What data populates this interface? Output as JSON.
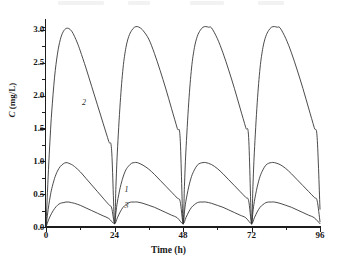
{
  "chart_data": {
    "type": "line",
    "title": "",
    "xlabel": "Time (h)",
    "ylabel": "C (mg/L)",
    "ylabel_italic_part": "C",
    "ylabel_rest": " (mg/L)",
    "xlim": [
      0,
      96
    ],
    "ylim": [
      0.0,
      3.15
    ],
    "grid": false,
    "legend_position": "inline-curve-labels",
    "x_ticks": [
      0,
      24,
      48,
      72,
      96
    ],
    "x_tick_labels": [
      "0",
      "24",
      "48",
      "72",
      "96"
    ],
    "x_minor_ticks": [
      12,
      36,
      60,
      84
    ],
    "y_ticks": [
      0.0,
      0.5,
      1.0,
      1.5,
      2.0,
      2.5,
      3.0
    ],
    "y_tick_labels": [
      "0.0",
      "0.5",
      "1.0",
      "1.5",
      "2.0",
      "2.5",
      "3.0"
    ],
    "y_minor_ticks": [
      0.25,
      0.75,
      1.25,
      1.75,
      2.25,
      2.75,
      3.05
    ],
    "dosing_interval_h": 24,
    "line_color": "#2b2b2b",
    "series": [
      {
        "name": "1",
        "label": "1",
        "label_x": 27.5,
        "label_y": 0.57,
        "peak_value": 0.98,
        "trough_value": 0.05,
        "time_to_peak_h": 7,
        "x": [
          0,
          0.5,
          1,
          1.5,
          2,
          3,
          4,
          5,
          6,
          7,
          8,
          9,
          10,
          12,
          14,
          16,
          18,
          20,
          22,
          23,
          24,
          24.5,
          25,
          26,
          27,
          28,
          29,
          30,
          31,
          32,
          34,
          36,
          38,
          40,
          42,
          44,
          46,
          47,
          48,
          48.5,
          49,
          50,
          51,
          52,
          53,
          54,
          55,
          56,
          58,
          60,
          62,
          64,
          66,
          68,
          70,
          71,
          72,
          72.5,
          73,
          74,
          75,
          76,
          77,
          78,
          79,
          80,
          82,
          84,
          86,
          88,
          90,
          92,
          94,
          95,
          96
        ],
        "y": [
          0.0,
          0.18,
          0.34,
          0.47,
          0.58,
          0.74,
          0.85,
          0.92,
          0.96,
          0.98,
          0.97,
          0.95,
          0.92,
          0.84,
          0.74,
          0.64,
          0.54,
          0.44,
          0.34,
          0.29,
          0.05,
          0.22,
          0.38,
          0.6,
          0.76,
          0.87,
          0.93,
          0.97,
          0.98,
          0.98,
          0.94,
          0.88,
          0.8,
          0.71,
          0.62,
          0.53,
          0.44,
          0.39,
          0.06,
          0.23,
          0.39,
          0.61,
          0.77,
          0.87,
          0.94,
          0.97,
          0.98,
          0.98,
          0.95,
          0.89,
          0.81,
          0.72,
          0.63,
          0.54,
          0.45,
          0.4,
          0.06,
          0.23,
          0.39,
          0.61,
          0.77,
          0.87,
          0.94,
          0.97,
          0.98,
          0.98,
          0.95,
          0.89,
          0.81,
          0.72,
          0.63,
          0.54,
          0.45,
          0.4,
          0.08
        ]
      },
      {
        "name": "2",
        "label": "2",
        "label_x": 12.6,
        "label_y": 1.88,
        "peak_value": 3.05,
        "trough_value": 0.06,
        "time_to_peak_h": 8,
        "x": [
          0,
          0.5,
          1,
          1.5,
          2,
          3,
          4,
          5,
          6,
          7,
          8,
          9,
          10,
          11,
          12,
          14,
          16,
          18,
          20,
          22,
          23,
          24,
          24.5,
          25,
          26,
          27,
          28,
          29,
          30,
          31,
          32,
          33,
          34,
          36,
          38,
          40,
          42,
          44,
          46,
          47,
          48,
          48.5,
          49,
          50,
          51,
          52,
          53,
          54,
          55,
          56,
          57,
          58,
          60,
          62,
          64,
          66,
          68,
          70,
          71,
          72,
          72.5,
          73,
          74,
          75,
          76,
          77,
          78,
          79,
          80,
          81,
          82,
          84,
          86,
          88,
          90,
          92,
          94,
          95,
          96
        ],
        "y": [
          0.0,
          0.52,
          0.99,
          1.4,
          1.75,
          2.28,
          2.63,
          2.85,
          2.97,
          3.02,
          3.02,
          2.98,
          2.9,
          2.8,
          2.68,
          2.42,
          2.14,
          1.86,
          1.58,
          1.3,
          1.16,
          0.06,
          0.62,
          1.14,
          1.89,
          2.42,
          2.73,
          2.9,
          2.99,
          3.04,
          3.05,
          3.03,
          2.99,
          2.86,
          2.64,
          2.38,
          2.1,
          1.8,
          1.5,
          1.35,
          0.06,
          0.62,
          1.14,
          1.89,
          2.42,
          2.73,
          2.9,
          2.99,
          3.04,
          3.05,
          3.04,
          3.03,
          2.87,
          2.65,
          2.39,
          2.11,
          1.81,
          1.51,
          1.36,
          0.06,
          0.62,
          1.14,
          1.89,
          2.42,
          2.73,
          2.9,
          2.99,
          3.04,
          3.05,
          3.04,
          3.03,
          2.87,
          2.65,
          2.39,
          2.11,
          1.81,
          1.51,
          1.36,
          0.27
        ]
      },
      {
        "name": "3",
        "label": "3",
        "label_x": 27.5,
        "label_y": 0.32,
        "peak_value": 0.38,
        "trough_value": 0.04,
        "time_to_peak_h": 8,
        "x": [
          0,
          1,
          2,
          3,
          4,
          5,
          6,
          7,
          8,
          9,
          10,
          12,
          14,
          16,
          18,
          20,
          22,
          24,
          25,
          26,
          27,
          28,
          29,
          30,
          31,
          32,
          34,
          36,
          38,
          40,
          42,
          44,
          46,
          48,
          49,
          50,
          51,
          52,
          53,
          54,
          55,
          56,
          58,
          60,
          62,
          64,
          66,
          68,
          70,
          72,
          73,
          74,
          75,
          76,
          77,
          78,
          79,
          80,
          82,
          84,
          86,
          88,
          90,
          92,
          94,
          96
        ],
        "y": [
          0.0,
          0.12,
          0.21,
          0.28,
          0.33,
          0.36,
          0.37,
          0.38,
          0.38,
          0.37,
          0.36,
          0.33,
          0.29,
          0.25,
          0.21,
          0.17,
          0.13,
          0.05,
          0.14,
          0.23,
          0.3,
          0.34,
          0.37,
          0.38,
          0.38,
          0.38,
          0.36,
          0.33,
          0.3,
          0.26,
          0.22,
          0.18,
          0.14,
          0.05,
          0.14,
          0.23,
          0.3,
          0.34,
          0.37,
          0.38,
          0.38,
          0.38,
          0.36,
          0.33,
          0.3,
          0.26,
          0.22,
          0.18,
          0.14,
          0.05,
          0.14,
          0.23,
          0.3,
          0.34,
          0.37,
          0.38,
          0.38,
          0.38,
          0.36,
          0.33,
          0.3,
          0.26,
          0.22,
          0.18,
          0.14,
          0.05
        ]
      }
    ]
  }
}
